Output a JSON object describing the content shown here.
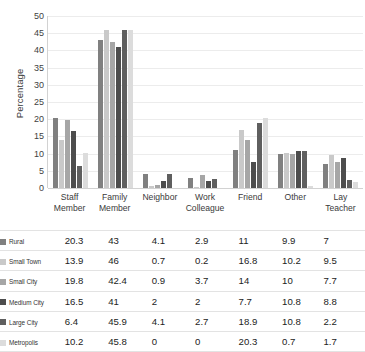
{
  "chart_data": {
    "type": "bar",
    "title": "",
    "xlabel": "",
    "ylabel": "Percentage",
    "ylim": [
      0,
      50
    ],
    "ytick_step": 5,
    "yticks": [
      0,
      5,
      10,
      15,
      20,
      25,
      30,
      35,
      40,
      45,
      50
    ],
    "grid": true,
    "legend_position": "table-row-labels",
    "categories": [
      "Staff Member",
      "Family Member",
      "Neighbor",
      "Work Colleague",
      "Friend",
      "Other",
      "Lay Teacher"
    ],
    "category_lines": [
      [
        "Staff",
        "Member"
      ],
      [
        "Family",
        "Member"
      ],
      [
        "Neighbor",
        ""
      ],
      [
        "Work",
        "Colleague"
      ],
      [
        "Friend",
        ""
      ],
      [
        "Other",
        ""
      ],
      [
        "Lay Teacher",
        ""
      ]
    ],
    "series": [
      {
        "name": "Rural",
        "color": "#808080",
        "values": [
          20.3,
          43,
          4.1,
          2.9,
          11,
          9.9,
          7
        ]
      },
      {
        "name": "Small Town",
        "color": "#c9c9c9",
        "values": [
          13.9,
          46,
          0.7,
          0.2,
          16.8,
          10.2,
          9.5
        ]
      },
      {
        "name": "Small City",
        "color": "#a6a6a6",
        "values": [
          19.8,
          42.4,
          0.9,
          3.7,
          14,
          10,
          7.7
        ]
      },
      {
        "name": "Medium City",
        "color": "#4d4d4d",
        "values": [
          16.5,
          41,
          2,
          2,
          7.7,
          10.8,
          8.8
        ]
      },
      {
        "name": "Large City",
        "color": "#5f5f5f",
        "values": [
          6.4,
          45.9,
          4.1,
          2.7,
          18.9,
          10.8,
          2.2
        ]
      },
      {
        "name": "Metropolis",
        "color": "#dcdcdc",
        "values": [
          10.2,
          45.8,
          0,
          0,
          20.3,
          0.7,
          1.7
        ]
      }
    ]
  },
  "table": {
    "rows": [
      {
        "label": "Rural",
        "values": [
          "20.3",
          "43",
          "4.1",
          "2.9",
          "11",
          "9.9",
          "7"
        ]
      },
      {
        "label": "Small Town",
        "values": [
          "13.9",
          "46",
          "0.7",
          "0.2",
          "16.8",
          "10.2",
          "9.5"
        ]
      },
      {
        "label": "Small City",
        "values": [
          "19.8",
          "42.4",
          "0.9",
          "3.7",
          "14",
          "10",
          "7.7"
        ]
      },
      {
        "label": "Medium City",
        "values": [
          "16.5",
          "41",
          "2",
          "2",
          "7.7",
          "10.8",
          "8.8"
        ]
      },
      {
        "label": "Large City",
        "values": [
          "6.4",
          "45.9",
          "4.1",
          "2.7",
          "18.9",
          "10.8",
          "2.2"
        ]
      },
      {
        "label": "Metropolis",
        "values": [
          "10.2",
          "45.8",
          "0",
          "0",
          "20.3",
          "0.7",
          "1.7"
        ]
      }
    ]
  }
}
